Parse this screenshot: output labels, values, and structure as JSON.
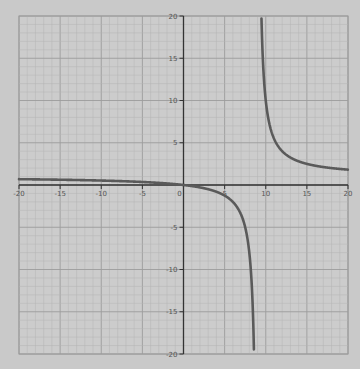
{
  "chart_data": {
    "type": "line",
    "title": "",
    "xlabel": "",
    "ylabel": "",
    "xlim": [
      -20,
      20
    ],
    "ylim": [
      -20,
      20
    ],
    "grid": true,
    "x_ticks": [
      -20,
      -15,
      -10,
      -5,
      0,
      5,
      10,
      15,
      20
    ],
    "x_tick_labels": [
      "-20",
      "-15",
      "-10",
      "-5",
      "0",
      "5",
      "10",
      "15",
      "20"
    ],
    "y_ticks": [
      -20,
      -15,
      -10,
      -5,
      5,
      10,
      15,
      20
    ],
    "y_tick_labels": [
      "-20",
      "-15",
      "-10",
      "-5",
      "5",
      "10",
      "15",
      "20"
    ],
    "vertical_asymptote": 9,
    "horizontal_asymptote": 1,
    "series": [
      {
        "name": "f(x)",
        "description": "rational function with vertical asymptote near x=9",
        "points_left_branch": [
          [
            -20,
            0.69
          ],
          [
            -15,
            0.63
          ],
          [
            -10,
            0.53
          ],
          [
            -5,
            0.36
          ],
          [
            0,
            0
          ],
          [
            3,
            -0.5
          ],
          [
            5,
            -1.25
          ],
          [
            7,
            -3.5
          ],
          [
            8,
            -8
          ],
          [
            8.5,
            -17
          ],
          [
            8.6,
            -20
          ]
        ],
        "points_right_branch": [
          [
            9.45,
            20
          ],
          [
            10,
            10
          ],
          [
            11,
            5.5
          ],
          [
            11.6,
            4.5
          ],
          [
            13,
            3.25
          ],
          [
            15,
            2.5
          ],
          [
            17,
            2.13
          ],
          [
            20,
            1.82
          ]
        ]
      }
    ]
  },
  "colors": {
    "background": "#c9c9c9",
    "grid_minor": "#b4b4b4",
    "grid_major": "#9c9c9c",
    "axis": "#333333",
    "curve": "#5a5a5a"
  }
}
